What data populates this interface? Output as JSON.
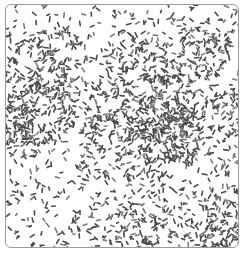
{
  "image": {
    "description": "Micrograph-style texture of scattered rod-shaped dark specks inside a bordered square",
    "caption": "",
    "colors": {
      "background": "#ffffff",
      "border": "#9a9a9a",
      "speck": "#4a4a4a",
      "speck_light": "#7a7a7a"
    },
    "speck_params": {
      "count": 2200,
      "min_length": 2,
      "max_length": 5,
      "width": 1.6,
      "seed": 1337
    }
  }
}
